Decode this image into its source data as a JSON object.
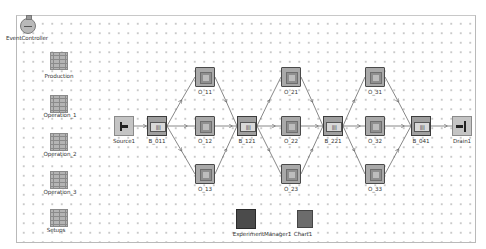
{
  "canvas": {
    "grid": "dotted",
    "colors": {
      "background": "#ffffff",
      "grid_dot": "#b8b8b8",
      "border": "#b9b9b9",
      "link": "#6a6a6a"
    }
  },
  "controls": [
    {
      "id": "eventcontroller",
      "label": "EventController",
      "icon": "stopwatch-icon"
    },
    {
      "id": "production",
      "label": "Production",
      "icon": "table-icon"
    },
    {
      "id": "operation1",
      "label": "Operation_1",
      "icon": "table-icon"
    },
    {
      "id": "operation2",
      "label": "Operation_2",
      "icon": "table-icon"
    },
    {
      "id": "operation3",
      "label": "Operation_3",
      "icon": "table-icon"
    },
    {
      "id": "setups",
      "label": "Setups",
      "icon": "table-icon"
    },
    {
      "id": "experimentmanager1",
      "label": "ExperimentManager1",
      "icon": "experiment-manager-icon"
    },
    {
      "id": "chart1",
      "label": "Chart1",
      "icon": "chart-icon"
    }
  ],
  "nodes": [
    {
      "id": "source1",
      "label": "Source1",
      "type": "source"
    },
    {
      "id": "b011",
      "label": "B_011",
      "type": "buffer",
      "glyph": "||||"
    },
    {
      "id": "o11",
      "label": "O_11",
      "type": "station"
    },
    {
      "id": "o12",
      "label": "O_12",
      "type": "station"
    },
    {
      "id": "o13",
      "label": "O_13",
      "type": "station"
    },
    {
      "id": "b121",
      "label": "B_121",
      "type": "buffer",
      "glyph": "||||"
    },
    {
      "id": "o21",
      "label": "O_21",
      "type": "station"
    },
    {
      "id": "o22",
      "label": "O_22",
      "type": "station"
    },
    {
      "id": "o23",
      "label": "O_23",
      "type": "station"
    },
    {
      "id": "b221",
      "label": "B_221",
      "type": "buffer",
      "glyph": "||||"
    },
    {
      "id": "o31",
      "label": "O_31",
      "type": "station"
    },
    {
      "id": "o32",
      "label": "O_32",
      "type": "station"
    },
    {
      "id": "o33",
      "label": "O_33",
      "type": "station"
    },
    {
      "id": "b041",
      "label": "B_041",
      "type": "buffer",
      "glyph": "||||"
    },
    {
      "id": "drain1",
      "label": "Drain1",
      "type": "drain"
    }
  ],
  "connectors": [
    [
      "Source1",
      "B_011"
    ],
    [
      "B_011",
      "O_11"
    ],
    [
      "B_011",
      "O_12"
    ],
    [
      "B_011",
      "O_13"
    ],
    [
      "O_11",
      "B_121"
    ],
    [
      "O_12",
      "B_121"
    ],
    [
      "O_13",
      "B_121"
    ],
    [
      "B_121",
      "O_21"
    ],
    [
      "B_121",
      "O_22"
    ],
    [
      "B_121",
      "O_23"
    ],
    [
      "O_21",
      "B_221"
    ],
    [
      "O_22",
      "B_221"
    ],
    [
      "O_23",
      "B_221"
    ],
    [
      "B_221",
      "O_31"
    ],
    [
      "B_221",
      "O_32"
    ],
    [
      "B_221",
      "O_33"
    ],
    [
      "O_31",
      "B_041"
    ],
    [
      "O_32",
      "B_041"
    ],
    [
      "O_33",
      "B_041"
    ],
    [
      "B_041",
      "Drain1"
    ]
  ]
}
